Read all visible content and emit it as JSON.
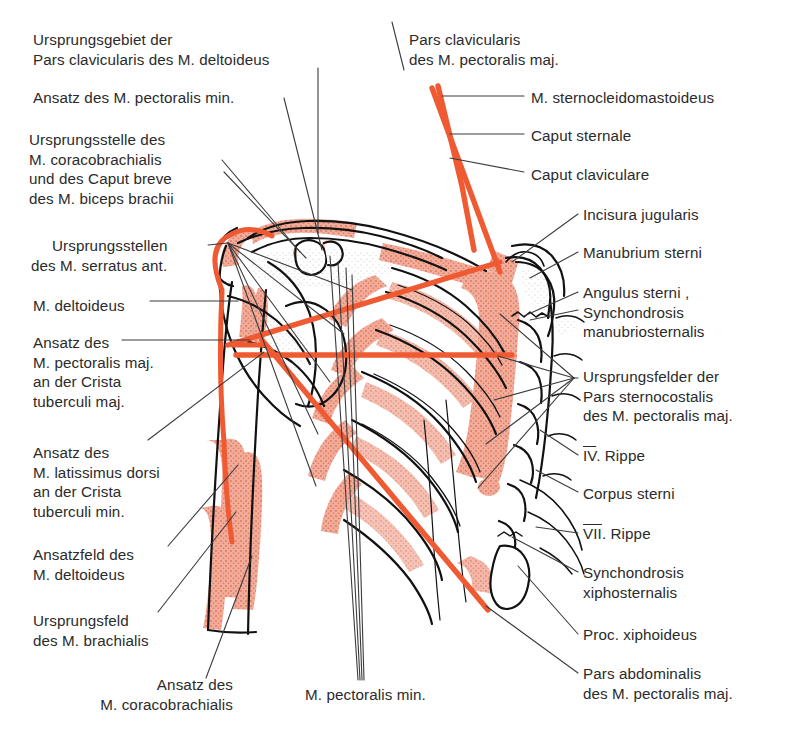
{
  "figure": {
    "colors": {
      "muscle_red": "#e8603c",
      "muscle_shade": "#e8806a",
      "bone_outline": "#1a1a1a",
      "leader_line": "#3a3a3a",
      "text": "#2b2b2b",
      "background": "#ffffff"
    }
  },
  "labels": {
    "left": [
      {
        "id": "ursprungsgebiet-pars-clavicularis-deltoideus",
        "lines": [
          "Ursprungsgebiet der",
          "Pars clavicularis des M. deltoideus"
        ],
        "x": 33,
        "y": 30
      },
      {
        "id": "ansatz-pectoralis-min",
        "lines": [
          "Ansatz des M. pectoralis min."
        ],
        "x": 33,
        "y": 88
      },
      {
        "id": "ursprungsstelle-coracobrachialis-biceps",
        "lines": [
          "Ursprungsstelle des",
          "M. coracobrachialis",
          "und des Caput breve",
          "des M. biceps brachii"
        ],
        "x": 29,
        "y": 130
      },
      {
        "id": "ursprungsstellen-serratus-ant",
        "lines": [
          "Ursprungsstellen",
          "des M. serratus ant."
        ],
        "x": 52,
        "y": 236
      },
      {
        "id": "m-deltoideus",
        "lines": [
          "M. deltoideus"
        ],
        "x": 33,
        "y": 296
      },
      {
        "id": "ansatz-pectoralis-maj-crista-tuberculi-maj",
        "lines": [
          "Ansatz des",
          "M. pectoralis maj.",
          "an der Crista",
          "tuberculi maj."
        ],
        "x": 33,
        "y": 333
      },
      {
        "id": "ansatz-latissimus-dorsi-crista-tuberculi-min",
        "lines": [
          "Ansatz des",
          "M. latissimus dorsi",
          "an der Crista",
          "tuberculi min."
        ],
        "x": 33,
        "y": 443
      },
      {
        "id": "ansatzfeld-deltoideus",
        "lines": [
          "Ansatzfeld des",
          "M. deltoideus"
        ],
        "x": 33,
        "y": 545
      },
      {
        "id": "ursprungsfeld-brachialis",
        "lines": [
          "Ursprungsfeld",
          "des M. brachialis"
        ],
        "x": 33,
        "y": 611
      },
      {
        "id": "ansatz-coracobrachialis",
        "lines": [
          "Ansatz des",
          "M. coracobrachialis"
        ],
        "x": 23,
        "y": 675,
        "align": "block-right",
        "width": 210
      }
    ],
    "right": [
      {
        "id": "pars-clavicularis-pectoralis-maj",
        "lines": [
          "Pars clavicularis",
          "des M. pectoralis maj."
        ],
        "x": 409,
        "y": 30
      },
      {
        "id": "m-sternocleidomastoideus",
        "lines": [
          "M. sternocleidomastoideus"
        ],
        "x": 531,
        "y": 92
      },
      {
        "id": "caput-sternale",
        "lines": [
          "Caput sternale"
        ],
        "x": 531,
        "y": 130
      },
      {
        "id": "caput-claviculare",
        "lines": [
          "Caput claviculare"
        ],
        "x": 531,
        "y": 170
      },
      {
        "id": "incisura-jugularis",
        "lines": [
          "Incisura jugularis"
        ],
        "x": 583,
        "y": 209
      },
      {
        "id": "manubrium-sterni",
        "lines": [
          "Manubrium sterni"
        ],
        "x": 583,
        "y": 248
      },
      {
        "id": "angulus-sterni-synchondrosis-manubriosternalis",
        "lines": [
          "Angulus sterni ,",
          "Synchondrosis",
          "manubriosternalis"
        ],
        "x": 583,
        "y": 288
      },
      {
        "id": "ursprungsfelder-pars-sternocostalis",
        "lines": [
          "Ursprungsfelder der",
          "Pars sternocostalis",
          "des M. pectoralis maj."
        ],
        "x": 583,
        "y": 372
      },
      {
        "id": "rippe-iv",
        "lines": [
          "IV. Rippe"
        ],
        "roman": "IV",
        "suffix": ". Rippe",
        "x": 583,
        "y": 451
      },
      {
        "id": "corpus-sterni",
        "lines": [
          "Corpus sterni"
        ],
        "x": 583,
        "y": 489
      },
      {
        "id": "rippe-vii",
        "lines": [
          "VII. Rippe"
        ],
        "roman": "VII",
        "suffix": ". Rippe",
        "x": 583,
        "y": 529
      },
      {
        "id": "synchondrosis-xiphosternalis",
        "lines": [
          "Synchondrosis",
          "xiphosternalis"
        ],
        "x": 583,
        "y": 568
      },
      {
        "id": "proc-xiphoideus",
        "lines": [
          "Proc. xiphoideus"
        ],
        "x": 583,
        "y": 630
      },
      {
        "id": "pars-abdominalis-pectoralis-maj",
        "lines": [
          "Pars abdominalis",
          "des M. pectoralis maj."
        ],
        "x": 583,
        "y": 669
      }
    ],
    "bottom": [
      {
        "id": "m-pectoralis-min",
        "lines": [
          "M. pectoralis min."
        ],
        "x": 305,
        "y": 690
      }
    ]
  }
}
